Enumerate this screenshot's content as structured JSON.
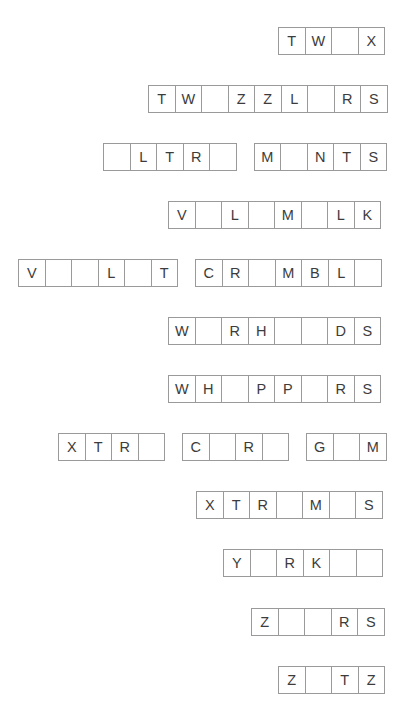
{
  "page": {
    "background_color": "#ffffff",
    "cell_border_color": "#9a9a9a",
    "letter_color": "#3c3c3c",
    "cell_size_px": 27.5,
    "row_count": 12
  },
  "rows": [
    {
      "index": 1,
      "top": 27,
      "left": 278,
      "groups": [
        {
          "letters": [
            "T",
            "W",
            "",
            "X"
          ]
        }
      ]
    },
    {
      "index": 2,
      "top": 85,
      "left": 148,
      "groups": [
        {
          "letters": [
            "T",
            "W",
            "",
            "Z",
            "Z",
            "L",
            "",
            "R",
            "S"
          ]
        }
      ]
    },
    {
      "index": 3,
      "top": 143,
      "left": 103,
      "groups": [
        {
          "letters": [
            "",
            "L",
            "T",
            "R",
            ""
          ]
        },
        {
          "letters": [
            "M",
            "",
            "N",
            "T",
            "S"
          ]
        }
      ]
    },
    {
      "index": 4,
      "top": 201,
      "left": 168,
      "groups": [
        {
          "letters": [
            "V",
            "",
            "L",
            "",
            "M",
            "",
            "L",
            "K"
          ]
        }
      ]
    },
    {
      "index": 5,
      "top": 259,
      "left": 18,
      "groups": [
        {
          "letters": [
            "V",
            "",
            "",
            "L",
            "",
            "T"
          ]
        },
        {
          "letters": [
            "C",
            "R",
            "",
            "M",
            "B",
            "L",
            ""
          ]
        }
      ]
    },
    {
      "index": 6,
      "top": 317,
      "left": 168,
      "groups": [
        {
          "letters": [
            "W",
            "",
            "R",
            "H",
            "",
            "",
            "D",
            "S"
          ]
        }
      ]
    },
    {
      "index": 7,
      "top": 375,
      "left": 168,
      "groups": [
        {
          "letters": [
            "W",
            "H",
            "",
            "P",
            "P",
            "",
            "R",
            "S"
          ]
        }
      ]
    },
    {
      "index": 8,
      "top": 433,
      "left": 58,
      "groups": [
        {
          "letters": [
            "X",
            "T",
            "R",
            ""
          ]
        },
        {
          "letters": [
            "C",
            "",
            "R",
            ""
          ]
        },
        {
          "letters": [
            "G",
            "",
            "M"
          ]
        }
      ]
    },
    {
      "index": 9,
      "top": 491,
      "left": 196,
      "groups": [
        {
          "letters": [
            "X",
            "T",
            "R",
            "",
            "M",
            "",
            "S"
          ]
        }
      ]
    },
    {
      "index": 10,
      "top": 549,
      "left": 223,
      "groups": [
        {
          "letters": [
            "Y",
            "",
            "R",
            "K",
            "",
            ""
          ]
        }
      ]
    },
    {
      "index": 11,
      "top": 608,
      "left": 251,
      "groups": [
        {
          "letters": [
            "Z",
            "",
            "",
            "R",
            "S"
          ]
        }
      ]
    },
    {
      "index": 12,
      "top": 666,
      "left": 278,
      "groups": [
        {
          "letters": [
            "Z",
            "",
            "T",
            "Z"
          ]
        }
      ]
    }
  ]
}
